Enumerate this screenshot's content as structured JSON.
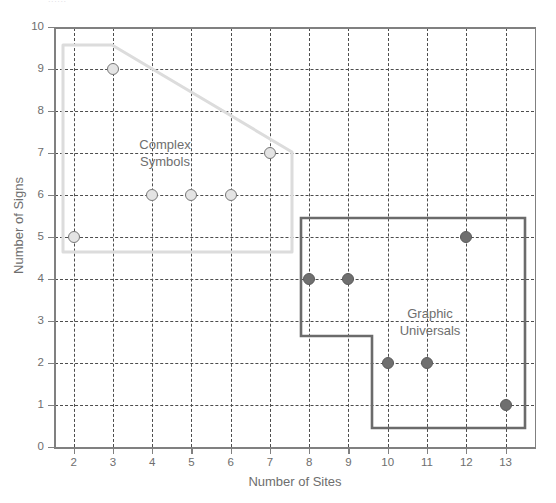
{
  "figure": {
    "clipped_header_fragment": "......",
    "background_color": "#ffffff",
    "axis_color": "#808080",
    "grid_color": "#4d4d4d",
    "text_color": "#6e6e6e"
  },
  "chart_data": {
    "type": "scatter",
    "title": "",
    "xlabel": "Number of Sites",
    "ylabel": "Number of Signs",
    "xlim": [
      1.5,
      13.75
    ],
    "ylim": [
      0,
      10
    ],
    "x_ticks": [
      2,
      3,
      4,
      5,
      6,
      7,
      8,
      9,
      10,
      11,
      12,
      13
    ],
    "y_ticks": [
      0,
      1,
      2,
      3,
      4,
      5,
      6,
      7,
      8,
      9,
      10
    ],
    "grid": true,
    "grid_style": "dashed",
    "legend_position": "inline-annotations",
    "series": [
      {
        "name": "Complex Symbols",
        "marker": "open-circle",
        "fill_color": "#e4e4e4",
        "edge_color": "#777777",
        "hull_color": "#dcdcdc",
        "points": [
          {
            "x": 2,
            "y": 5
          },
          {
            "x": 3,
            "y": 9
          },
          {
            "x": 4,
            "y": 6
          },
          {
            "x": 5,
            "y": 6
          },
          {
            "x": 6,
            "y": 6
          },
          {
            "x": 7,
            "y": 7
          }
        ]
      },
      {
        "name": "Graphic Universals",
        "marker": "filled-circle",
        "fill_color": "#6f6f6f",
        "edge_color": "#5a5a5a",
        "hull_color": "#6b6b6b",
        "points": [
          {
            "x": 8,
            "y": 4
          },
          {
            "x": 9,
            "y": 4
          },
          {
            "x": 10,
            "y": 2
          },
          {
            "x": 11,
            "y": 2
          },
          {
            "x": 12,
            "y": 5
          },
          {
            "x": 13,
            "y": 1
          }
        ]
      }
    ],
    "annotations": [
      {
        "text": "Complex\nSymbols",
        "x": 4.5,
        "y": 7.3
      },
      {
        "text": "Graphic\nUniversals",
        "x": 11.0,
        "y": 3.3
      }
    ]
  }
}
